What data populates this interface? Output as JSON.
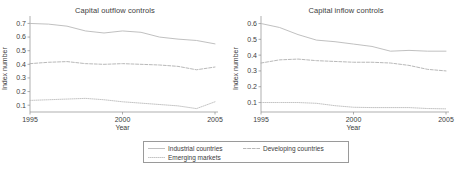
{
  "figure": {
    "legend": {
      "entries": [
        {
          "label": "Industrial countries",
          "style": "solid",
          "color": "#b9b9b9",
          "swatch": "legend-swatch-industrial"
        },
        {
          "label": "Developing countries",
          "style": "dashed",
          "color": "#b0b0b0",
          "swatch": "legend-swatch-developing"
        },
        {
          "label": "Emerging markets",
          "style": "dotted",
          "color": "#bdbdbd",
          "swatch": "legend-swatch-emerging"
        }
      ]
    }
  },
  "chart_data": [
    {
      "type": "line",
      "title": "Capital outflow controls",
      "xlabel": "Year",
      "ylabel": "Index number",
      "xlim": [
        1995,
        2005
      ],
      "ylim": [
        0.05,
        0.74
      ],
      "xticks": [
        1995,
        2000,
        2005
      ],
      "xticklabels": [
        "1995",
        "2000",
        "2005"
      ],
      "yticks": [
        0.1,
        0.2,
        0.3,
        0.4,
        0.5,
        0.6,
        0.7
      ],
      "yticklabels": [
        "0.1",
        "0.2",
        "0.3",
        "0.4",
        "0.5",
        "0.6",
        "0.7"
      ],
      "grid": false,
      "legend_position": "below-figure",
      "x": [
        1995,
        1996,
        1997,
        1998,
        1999,
        2000,
        2001,
        2002,
        2003,
        2004,
        2005
      ],
      "series": [
        {
          "name": "Industrial countries",
          "style": "solid",
          "color": "#b9b9b9",
          "values": [
            0.7,
            0.695,
            0.68,
            0.645,
            0.63,
            0.645,
            0.635,
            0.6,
            0.585,
            0.575,
            0.55
          ]
        },
        {
          "name": "Developing countries",
          "style": "dashed",
          "color": "#b0b0b0",
          "values": [
            0.405,
            0.415,
            0.42,
            0.405,
            0.4,
            0.405,
            0.4,
            0.395,
            0.385,
            0.36,
            0.38
          ]
        },
        {
          "name": "Emerging markets",
          "style": "dotted",
          "color": "#bdbdbd",
          "values": [
            0.135,
            0.14,
            0.145,
            0.15,
            0.14,
            0.125,
            0.115,
            0.105,
            0.095,
            0.075,
            0.125
          ]
        }
      ]
    },
    {
      "type": "line",
      "title": "Capital inflow controls",
      "xlabel": "Year",
      "ylabel": "Index number",
      "xlim": [
        1995,
        2005
      ],
      "ylim": [
        0.04,
        0.635
      ],
      "xticks": [
        1995,
        2000,
        2005
      ],
      "xticklabels": [
        "1995",
        "2000",
        "2005"
      ],
      "yticks": [
        0.1,
        0.2,
        0.3,
        0.4,
        0.5,
        0.6
      ],
      "yticklabels": [
        "0.1",
        "0.2",
        "0.3",
        "0.4",
        "0.5",
        "0.6"
      ],
      "grid": false,
      "legend_position": "below-figure",
      "x": [
        1995,
        1996,
        1997,
        1998,
        1999,
        2000,
        2001,
        2002,
        2003,
        2004,
        2005
      ],
      "series": [
        {
          "name": "Industrial countries",
          "style": "solid",
          "color": "#b9b9b9",
          "values": [
            0.6,
            0.575,
            0.53,
            0.495,
            0.485,
            0.47,
            0.455,
            0.425,
            0.43,
            0.425,
            0.425
          ]
        },
        {
          "name": "Developing countries",
          "style": "dashed",
          "color": "#b0b0b0",
          "values": [
            0.35,
            0.37,
            0.375,
            0.365,
            0.36,
            0.355,
            0.355,
            0.35,
            0.335,
            0.31,
            0.3
          ]
        },
        {
          "name": "Emerging markets",
          "style": "dotted",
          "color": "#bdbdbd",
          "values": [
            0.1,
            0.1,
            0.1,
            0.095,
            0.08,
            0.07,
            0.068,
            0.068,
            0.068,
            0.062,
            0.06
          ]
        }
      ]
    }
  ]
}
